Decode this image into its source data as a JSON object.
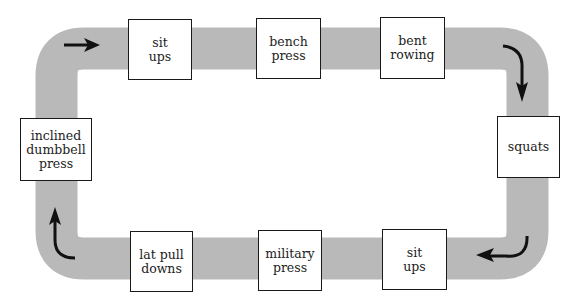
{
  "diagram": {
    "type": "circuit-training-loop",
    "colors": {
      "track": "#b9b9b9",
      "box_border": "#1a1a1a",
      "arrow": "#111111",
      "background": "#ffffff"
    },
    "stations": [
      {
        "id": "s1",
        "label": "sit\nups"
      },
      {
        "id": "s2",
        "label": "bench\npress"
      },
      {
        "id": "s3",
        "label": "bent\nrowing"
      },
      {
        "id": "s4",
        "label": "squats"
      },
      {
        "id": "s5",
        "label": "sit\nups"
      },
      {
        "id": "s6",
        "label": "military\npress"
      },
      {
        "id": "s7",
        "label": "lat pull\ndowns"
      },
      {
        "id": "s8",
        "label": "inclined\ndumbbell\npress"
      }
    ],
    "flow_direction": "clockwise",
    "arrows": [
      "top-left-right",
      "top-right-down",
      "bottom-right-left",
      "bottom-left-up"
    ]
  }
}
